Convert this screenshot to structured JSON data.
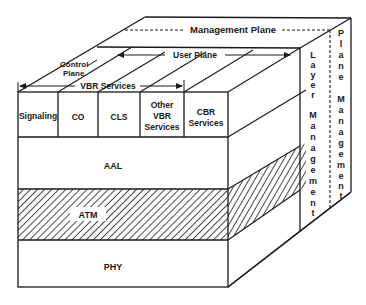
{
  "diagram": {
    "planes": {
      "management_plane": "Management Plane",
      "user_plane": "User Plane",
      "control_plane_line1": "Control",
      "control_plane_line2": "Plane",
      "vbr_services": "VBR Services"
    },
    "services": [
      {
        "line1": "Signaling",
        "line2": "",
        "line3": ""
      },
      {
        "line1": "CO",
        "line2": "",
        "line3": ""
      },
      {
        "line1": "CLS",
        "line2": "",
        "line3": ""
      },
      {
        "line1": "Other",
        "line2": "VBR",
        "line3": "Services"
      },
      {
        "line1": "CBR",
        "line2": "Services",
        "line3": ""
      }
    ],
    "layers": {
      "aal": "AAL",
      "atm": "ATM",
      "phy": "PHY"
    },
    "side_labels": {
      "layer_management": [
        "L",
        "a",
        "y",
        "e",
        "r",
        "",
        "M",
        "a",
        "n",
        "a",
        "g",
        "e",
        "m",
        "e",
        "n",
        "t"
      ],
      "plane_management": [
        "P",
        "l",
        "a",
        "n",
        "e",
        "",
        "M",
        "a",
        "n",
        "a",
        "g",
        "e",
        "m",
        "e",
        "n",
        "t"
      ]
    },
    "colors": {
      "line": "#1a1a1a",
      "background": "#ffffff"
    }
  }
}
